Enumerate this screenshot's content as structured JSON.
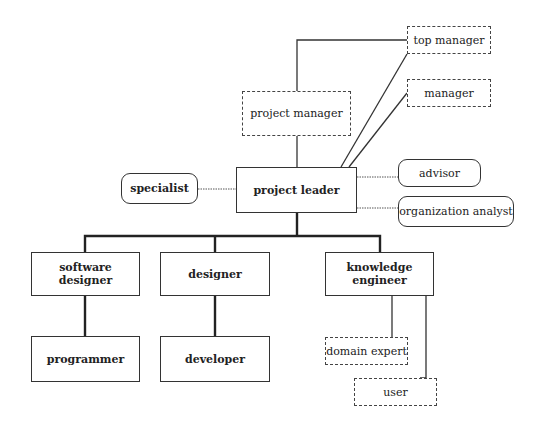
{
  "diagram": {
    "type": "organization-chart",
    "nodes": {
      "top_manager": {
        "label": "top manager",
        "style": "dashed"
      },
      "manager": {
        "label": "manager",
        "style": "dashed"
      },
      "project_manager": {
        "label": "project manager",
        "style": "dashed"
      },
      "project_leader": {
        "label": "project leader",
        "style": "solid-bold"
      },
      "specialist": {
        "label": "specialist",
        "style": "rounded-bold"
      },
      "advisor": {
        "label": "advisor",
        "style": "rounded"
      },
      "organization_analyst": {
        "label": "organization analyst",
        "style": "rounded"
      },
      "software_designer": {
        "label": "software designer",
        "style": "solid-bold"
      },
      "designer": {
        "label": "designer",
        "style": "solid-bold"
      },
      "knowledge_engineer": {
        "label": "knowledge engineer",
        "style": "solid-bold"
      },
      "programmer": {
        "label": "programmer",
        "style": "solid-bold"
      },
      "developer": {
        "label": "developer",
        "style": "solid-bold"
      },
      "domain_expert": {
        "label": "domain expert",
        "style": "dashed"
      },
      "user": {
        "label": "user",
        "style": "dashed"
      }
    },
    "edges": [
      {
        "from": "project_manager",
        "to": "top_manager",
        "line": "thin"
      },
      {
        "from": "project_leader",
        "to": "project_manager",
        "line": "thin"
      },
      {
        "from": "project_leader",
        "to": "top_manager",
        "line": "thin"
      },
      {
        "from": "project_leader",
        "to": "manager",
        "line": "thin"
      },
      {
        "from": "project_leader",
        "to": "specialist",
        "line": "dotted"
      },
      {
        "from": "project_leader",
        "to": "advisor",
        "line": "dotted"
      },
      {
        "from": "project_leader",
        "to": "organization_analyst",
        "line": "dotted"
      },
      {
        "from": "project_leader",
        "to": "software_designer",
        "line": "thick"
      },
      {
        "from": "project_leader",
        "to": "designer",
        "line": "thick"
      },
      {
        "from": "project_leader",
        "to": "knowledge_engineer",
        "line": "thick"
      },
      {
        "from": "software_designer",
        "to": "programmer",
        "line": "thick"
      },
      {
        "from": "designer",
        "to": "developer",
        "line": "thick"
      },
      {
        "from": "knowledge_engineer",
        "to": "domain_expert",
        "line": "thin"
      },
      {
        "from": "knowledge_engineer",
        "to": "user",
        "line": "thin"
      }
    ]
  }
}
